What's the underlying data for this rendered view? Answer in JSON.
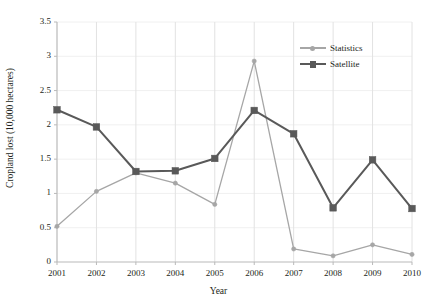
{
  "chart_data": {
    "type": "line",
    "title": "",
    "xlabel": "Year",
    "ylabel": "Cropland lost (10,000 hectares)",
    "categories": [
      "2001",
      "2002",
      "2003",
      "2004",
      "2005",
      "2006",
      "2007",
      "2008",
      "2009",
      "2010"
    ],
    "x": [
      2001,
      2002,
      2003,
      2004,
      2005,
      2006,
      2007,
      2008,
      2009,
      2010
    ],
    "xlim": [
      2001,
      2010
    ],
    "ylim": [
      0,
      3.5
    ],
    "yticks": [
      "0",
      "0.5",
      "1",
      "1.5",
      "2",
      "2.5",
      "3",
      "3.5"
    ],
    "ytick_values": [
      0,
      0.5,
      1,
      1.5,
      2,
      2.5,
      3,
      3.5
    ],
    "grid": "vertical-major-light",
    "legend_position": "top-right",
    "series": [
      {
        "name": "Statistics",
        "color": "#a6a6a6",
        "marker": "circle",
        "values": [
          0.52,
          1.03,
          1.3,
          1.15,
          0.84,
          2.93,
          0.19,
          0.09,
          0.25,
          0.11
        ]
      },
      {
        "name": "Satellite",
        "color": "#595959",
        "marker": "square",
        "values": [
          2.22,
          1.97,
          1.32,
          1.33,
          1.51,
          2.21,
          1.87,
          0.79,
          1.49,
          0.78
        ]
      }
    ]
  },
  "legend": {
    "items": [
      {
        "label": "Statistics"
      },
      {
        "label": "Satellite"
      }
    ]
  },
  "axes": {
    "x_title": "Year",
    "y_title": "Cropland lost (10,000 hectares)"
  }
}
